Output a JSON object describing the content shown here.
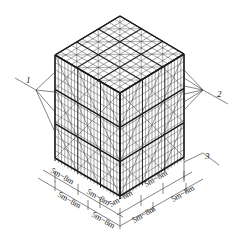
{
  "figure": {
    "type": "isometric scaffolding diagram",
    "colors": {
      "line": "#1a1a1a",
      "grid": "#333333",
      "background": "#ffffff"
    }
  },
  "callouts": [
    {
      "id": "1",
      "label": "1",
      "side": "left"
    },
    {
      "id": "2",
      "label": "2",
      "side": "right"
    },
    {
      "id": "3",
      "label": "3",
      "side": "right-bottom"
    }
  ],
  "dimensions": {
    "left_outer": [
      "5m~8m",
      "5m~8m"
    ],
    "left_inner": [
      "5m~8m",
      "5m~8m"
    ],
    "right_outer": [
      "5m~8m",
      "5m~8m"
    ],
    "right_inner": [
      "5m~8m",
      "5m~8m"
    ]
  }
}
